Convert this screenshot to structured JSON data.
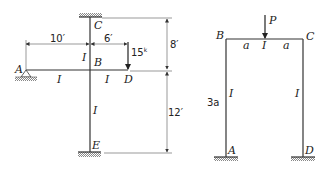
{
  "diagram_left": {
    "nodes": {
      "A": "A",
      "B": "B",
      "C": "C",
      "D": "D",
      "E": "E"
    },
    "members": [
      {
        "id": "AB",
        "label": "I"
      },
      {
        "id": "BD",
        "label": "I"
      },
      {
        "id": "BC",
        "label": "I"
      },
      {
        "id": "BE",
        "label": "I"
      }
    ],
    "dimensions": {
      "AB": "10′",
      "BD": "6′",
      "CB": "8′",
      "BE": "12′"
    },
    "load": {
      "value": "15",
      "unit": "k"
    }
  },
  "diagram_right": {
    "nodes": {
      "A": "A",
      "B": "B",
      "C": "C",
      "D": "D"
    },
    "members": [
      {
        "id": "BC",
        "label": "I"
      },
      {
        "id": "AB",
        "label": "I"
      },
      {
        "id": "CD",
        "label": "I"
      }
    ],
    "dimensions": {
      "left_half": "a",
      "right_half": "a",
      "height": "3a"
    },
    "load": {
      "value": "P"
    }
  }
}
